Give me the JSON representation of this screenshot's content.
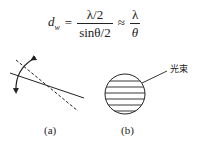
{
  "formula": {
    "lhs_var": "d",
    "lhs_sub": "w",
    "equals": "=",
    "frac1_num": "λ/2",
    "frac1_den": "sinθ/2",
    "approx": "≈",
    "frac2_num": "λ",
    "frac2_den": "θ"
  },
  "diagram_a": {
    "caption": "(a)",
    "elements": [
      "solid-line",
      "dashed-line",
      "rotation-arrow"
    ]
  },
  "diagram_b": {
    "caption": "(b)",
    "callout_label": "光束",
    "hatch_line_count": 6
  },
  "colors": {
    "ink": "#222222",
    "background": "#ffffff"
  }
}
